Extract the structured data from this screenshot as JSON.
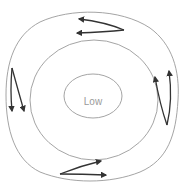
{
  "diagram": {
    "center_label": "Low",
    "colors": {
      "isobar": "#9a9a9a",
      "arrow": "#333333",
      "label": "#9a9a9a",
      "background": "#ffffff"
    },
    "isobars": [
      {
        "name": "inner",
        "shape": "ellipse"
      },
      {
        "name": "middle",
        "shape": "ellipse"
      },
      {
        "name": "outer",
        "shape": "rounded-blob"
      }
    ],
    "wind_arrows": [
      {
        "position": "top",
        "direction": "left",
        "count": 2
      },
      {
        "position": "left",
        "direction": "down",
        "count": 2
      },
      {
        "position": "bottom",
        "direction": "right",
        "count": 2
      },
      {
        "position": "right",
        "direction": "up",
        "count": 2
      }
    ]
  }
}
